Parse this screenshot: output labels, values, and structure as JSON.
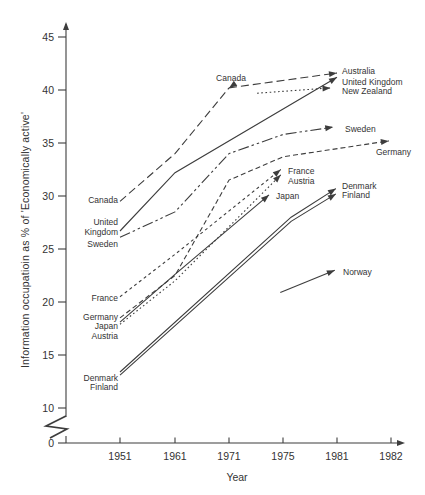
{
  "figure": {
    "background": "#ffffff",
    "line_color": "#3d3d3d",
    "text_color": "#333333"
  },
  "chart_data": {
    "type": "line",
    "title": "",
    "xlabel": "Year",
    "ylabel": "Information occupatioin as % of 'Economically active'",
    "x_tick_labels": [
      "1951",
      "1961",
      "1971",
      "1975",
      "1981",
      "1982"
    ],
    "y_tick_values": [
      0,
      10,
      15,
      20,
      25,
      30,
      35,
      40,
      45
    ],
    "ylim_displayed": [
      10,
      45
    ],
    "axis_break_between": [
      0,
      10
    ],
    "grid": false,
    "legend": "inline-labels",
    "series": [
      {
        "name": "Canada",
        "style": "long-dash",
        "arrow": true,
        "arrow_angle": 145,
        "points": [
          {
            "t": 0,
            "year": 1951,
            "value": 29.5
          },
          {
            "t": 1,
            "year": 1961,
            "value": 34.0
          },
          {
            "t": 2,
            "year": 1971,
            "value": 40.2
          }
        ]
      },
      {
        "name": "Australia",
        "style": "long-dash",
        "arrow": true,
        "points": [
          {
            "t": 2,
            "year": 1971,
            "value": 40.2
          },
          {
            "t": 4,
            "year": 1981,
            "value": 41.6
          }
        ]
      },
      {
        "name": "United Kingdom",
        "style": "solid",
        "arrow": true,
        "points": [
          {
            "t": 0,
            "year": 1951,
            "value": 26.7
          },
          {
            "t": 1,
            "year": 1961,
            "value": 32.2
          },
          {
            "t": 4,
            "year": 1981,
            "value": 41.2
          }
        ]
      },
      {
        "name": "New Zealand",
        "style": "dotted",
        "arrow": true,
        "points": [
          {
            "t": 2.52,
            "year": 1973,
            "value": 39.7
          },
          {
            "t": 3.88,
            "year": 1981,
            "value": 40.2
          }
        ]
      },
      {
        "name": "Sweden",
        "style": "dash-dot-dot",
        "arrow": true,
        "points": [
          {
            "t": 0,
            "year": 1951,
            "value": 26.1
          },
          {
            "t": 1,
            "year": 1961,
            "value": 28.5
          },
          {
            "t": 2,
            "year": 1971,
            "value": 34.0
          },
          {
            "t": 3,
            "year": 1975,
            "value": 35.8
          },
          {
            "t": 3.93,
            "year": 1981,
            "value": 36.5
          }
        ]
      },
      {
        "name": "Germany",
        "style": "dash",
        "arrow": true,
        "points": [
          {
            "t": 0,
            "year": 1951,
            "value": 18.5
          },
          {
            "t": 1,
            "year": 1961,
            "value": 22.5
          },
          {
            "t": 2,
            "year": 1971,
            "value": 31.5
          },
          {
            "t": 3,
            "year": 1975,
            "value": 33.7
          },
          {
            "t": 4.96,
            "year": 1982,
            "value": 35.2
          }
        ]
      },
      {
        "name": "France",
        "style": "short-dash",
        "arrow": true,
        "points": [
          {
            "t": 0,
            "year": 1951,
            "value": 20.5
          },
          {
            "t": 1,
            "year": 1961,
            "value": 24.5
          },
          {
            "t": 2.96,
            "year": 1975,
            "value": 32.5
          }
        ]
      },
      {
        "name": "Austria",
        "style": "dotted",
        "arrow": true,
        "points": [
          {
            "t": 0,
            "year": 1951,
            "value": 17.9
          },
          {
            "t": 1,
            "year": 1961,
            "value": 22.0
          },
          {
            "t": 2.96,
            "year": 1975,
            "value": 32.0
          }
        ]
      },
      {
        "name": "Japan",
        "style": "solid",
        "arrow": true,
        "points": [
          {
            "t": 0,
            "year": 1951,
            "value": 18.1
          },
          {
            "t": 1,
            "year": 1961,
            "value": 22.6
          },
          {
            "t": 2.74,
            "year": 1974,
            "value": 30.1
          }
        ]
      },
      {
        "name": "Denmark",
        "style": "solid",
        "arrow": true,
        "points": [
          {
            "t": 0,
            "year": 1951,
            "value": 13.4
          },
          {
            "t": 3.15,
            "year": 1976,
            "value": 28.0
          },
          {
            "t": 3.98,
            "year": 1981,
            "value": 30.7
          }
        ]
      },
      {
        "name": "Finland",
        "style": "solid",
        "arrow": true,
        "points": [
          {
            "t": 0,
            "year": 1951,
            "value": 13.1
          },
          {
            "t": 3.15,
            "year": 1976,
            "value": 27.6
          },
          {
            "t": 3.98,
            "year": 1981,
            "value": 30.2
          }
        ]
      },
      {
        "name": "Norway",
        "style": "solid",
        "arrow": true,
        "points": [
          {
            "t": 2.95,
            "year": 1975,
            "value": 20.9
          },
          {
            "t": 3.96,
            "year": 1981,
            "value": 23.0
          }
        ]
      }
    ],
    "labels": [
      {
        "text": "Canada",
        "side": "left",
        "x": 118,
        "y": 203,
        "anchor": "end"
      },
      {
        "text": "United",
        "side": "left",
        "x": 118,
        "y": 225,
        "anchor": "end"
      },
      {
        "text": "Kingdom",
        "side": "left",
        "x": 118,
        "y": 235,
        "anchor": "end"
      },
      {
        "text": "Sweden",
        "side": "left",
        "x": 118,
        "y": 247,
        "anchor": "end"
      },
      {
        "text": "France",
        "side": "left",
        "x": 118,
        "y": 301,
        "anchor": "end"
      },
      {
        "text": "Germany",
        "side": "left",
        "x": 118,
        "y": 320,
        "anchor": "end"
      },
      {
        "text": "Japan",
        "side": "left",
        "x": 118,
        "y": 329,
        "anchor": "end"
      },
      {
        "text": "Austria",
        "side": "left",
        "x": 118,
        "y": 339,
        "anchor": "end"
      },
      {
        "text": "Denmark",
        "side": "left",
        "x": 118,
        "y": 381,
        "anchor": "end"
      },
      {
        "text": "Finland",
        "side": "left",
        "x": 118,
        "y": 390,
        "anchor": "end"
      },
      {
        "text": "Canada",
        "side": "top",
        "x": 231,
        "y": 81,
        "anchor": "middle"
      },
      {
        "text": "Australia",
        "side": "right",
        "x": 342,
        "y": 74,
        "anchor": "start"
      },
      {
        "text": "United Kingdom",
        "side": "right",
        "x": 342,
        "y": 85,
        "anchor": "start"
      },
      {
        "text": "New Zealand",
        "side": "right",
        "x": 342,
        "y": 94,
        "anchor": "start"
      },
      {
        "text": "Sweden",
        "side": "right",
        "x": 345,
        "y": 132,
        "anchor": "start"
      },
      {
        "text": "Germany",
        "side": "right",
        "x": 376,
        "y": 155,
        "anchor": "start"
      },
      {
        "text": "France",
        "side": "right",
        "x": 288,
        "y": 174,
        "anchor": "start"
      },
      {
        "text": "Austria",
        "side": "right",
        "x": 288,
        "y": 184,
        "anchor": "start"
      },
      {
        "text": "Japan",
        "side": "right",
        "x": 276,
        "y": 199,
        "anchor": "start"
      },
      {
        "text": "Denmark",
        "side": "right",
        "x": 342,
        "y": 189,
        "anchor": "start"
      },
      {
        "text": "Finland",
        "side": "right",
        "x": 342,
        "y": 198,
        "anchor": "start"
      },
      {
        "text": "Norway",
        "side": "right",
        "x": 343,
        "y": 275,
        "anchor": "start"
      }
    ]
  }
}
